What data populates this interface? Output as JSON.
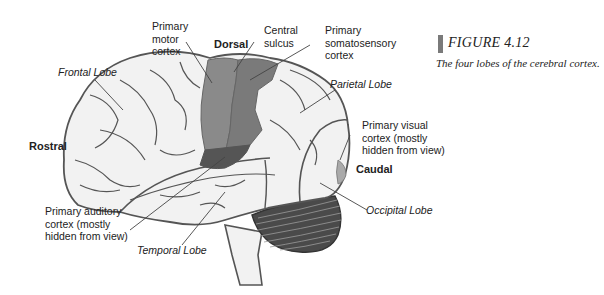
{
  "figure": {
    "number_label": "FIGURE 4.12",
    "caption": "The four lobes of the cerebral cortex.",
    "accent_bar_color": "#7a7a7a"
  },
  "directions": {
    "dorsal": "Dorsal",
    "rostral": "Rostral",
    "caudal": "Caudal"
  },
  "labels": {
    "primary_motor_cortex": [
      "Primary",
      "motor",
      "cortex"
    ],
    "central_sulcus": [
      "Central",
      "sulcus"
    ],
    "primary_somatosensory_cortex": [
      "Primary",
      "somatosensory",
      "cortex"
    ],
    "frontal_lobe": "Frontal Lobe",
    "parietal_lobe": "Parietal Lobe",
    "primary_visual_cortex": [
      "Primary visual",
      "cortex (mostly",
      "hidden from view)"
    ],
    "primary_auditory_cortex": [
      "Primary auditory",
      "cortex (mostly",
      "hidden from view)"
    ],
    "temporal_lobe": "Temporal Lobe",
    "occipital_lobe": "Occipital Lobe"
  },
  "colors": {
    "brain_fill": "#f2f2f2",
    "outline": "#555555",
    "motor_cortex": "#8a8a8a",
    "somatosensory_cortex": "#7a7a7a",
    "auditory_cortex": "#555555",
    "visual_cortex": "#aaaaaa",
    "cerebellum": "#4a4a4a"
  }
}
